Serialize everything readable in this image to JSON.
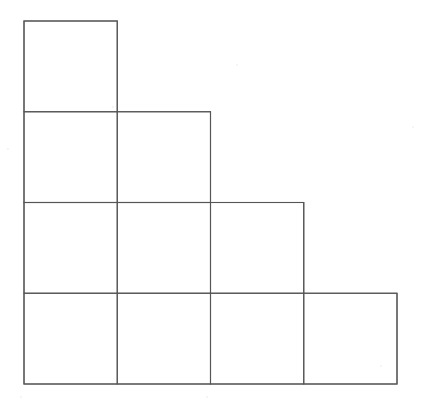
{
  "figure": {
    "kind": "staircase-grid",
    "background_color": "#ffffff",
    "line_color": "#555555",
    "line_width": 1.1,
    "origin": {
      "x": 24,
      "y": 21
    },
    "cell": {
      "width": 93.25,
      "height": 90.75
    },
    "columns": 4,
    "rows": 4,
    "column_edges_x": [
      24,
      117.25,
      210.5,
      303.75,
      397
    ],
    "row_edges_y": [
      21,
      111.75,
      202.5,
      293.25,
      384
    ],
    "row_square_counts": [
      1,
      2,
      3,
      4
    ],
    "total_squares": 10,
    "squares": [
      {
        "row": 1,
        "col": 1,
        "x": 24,
        "y": 21,
        "width": 93.25,
        "height": 90.75
      },
      {
        "row": 2,
        "col": 1,
        "x": 24,
        "y": 111.75,
        "width": 93.25,
        "height": 90.75
      },
      {
        "row": 2,
        "col": 2,
        "x": 117.25,
        "y": 111.75,
        "width": 93.25,
        "height": 90.75
      },
      {
        "row": 3,
        "col": 1,
        "x": 24,
        "y": 202.5,
        "width": 93.25,
        "height": 90.75
      },
      {
        "row": 3,
        "col": 2,
        "x": 117.25,
        "y": 202.5,
        "width": 93.25,
        "height": 90.75
      },
      {
        "row": 3,
        "col": 3,
        "x": 210.5,
        "y": 202.5,
        "width": 93.25,
        "height": 90.75
      },
      {
        "row": 4,
        "col": 1,
        "x": 24,
        "y": 293.25,
        "width": 93.25,
        "height": 90.75
      },
      {
        "row": 4,
        "col": 2,
        "x": 117.25,
        "y": 293.25,
        "width": 93.25,
        "height": 90.75
      },
      {
        "row": 4,
        "col": 3,
        "x": 210.5,
        "y": 293.25,
        "width": 93.25,
        "height": 90.75
      },
      {
        "row": 4,
        "col": 4,
        "x": 303.75,
        "y": 293.25,
        "width": 93.25,
        "height": 90.75
      }
    ],
    "outline_path": "M 24 21 L 117.25 21 L 117.25 111.75 L 210.5 111.75 L 210.5 202.5 L 303.75 202.5 L 303.75 293.25 L 397 293.25 L 397 384 L 24 384 Z",
    "interior_horizontal_lines": [
      {
        "y": 111.75,
        "x1": 24,
        "x2": 117.25
      },
      {
        "y": 202.5,
        "x1": 24,
        "x2": 210.5
      },
      {
        "y": 293.25,
        "x1": 24,
        "x2": 303.75
      }
    ],
    "interior_vertical_lines": [
      {
        "x": 117.25,
        "y1": 111.75,
        "y2": 384
      },
      {
        "x": 210.5,
        "y1": 202.5,
        "y2": 384
      },
      {
        "x": 303.75,
        "y1": 293.25,
        "y2": 384
      }
    ],
    "specks": [
      {
        "x": 236,
        "y": 64,
        "size": 2
      },
      {
        "x": 112,
        "y": 106,
        "size": 2
      },
      {
        "x": 7,
        "y": 148,
        "size": 2
      },
      {
        "x": 412,
        "y": 126,
        "size": 2
      },
      {
        "x": 380,
        "y": 365,
        "size": 2
      },
      {
        "x": 20,
        "y": 396,
        "size": 2
      },
      {
        "x": 206,
        "y": 396,
        "size": 2
      }
    ]
  }
}
